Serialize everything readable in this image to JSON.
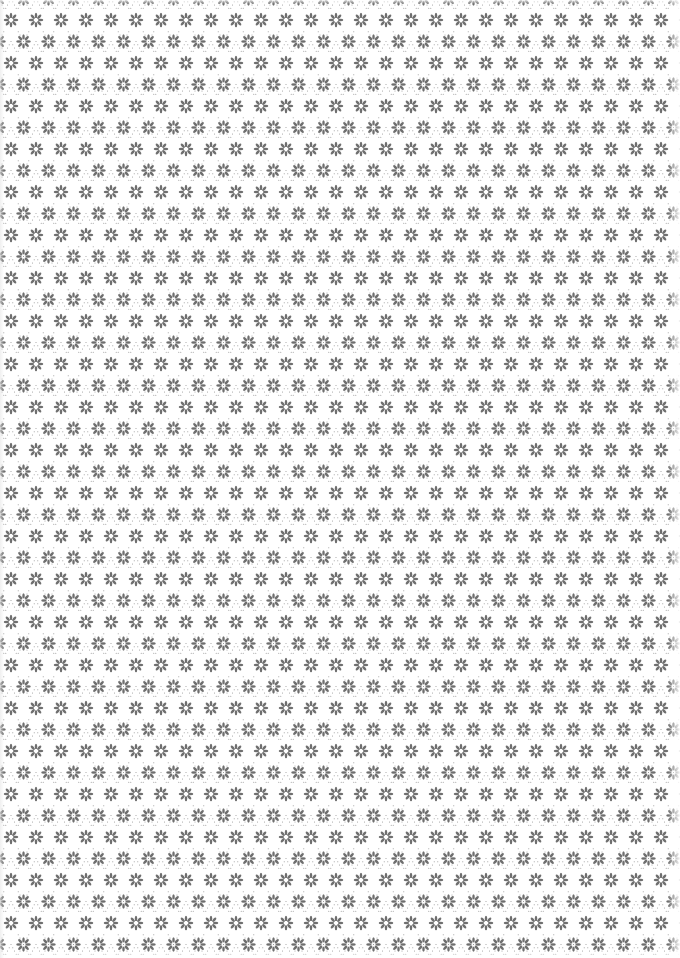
{
  "pattern": {
    "motif": "eight-petal-flower",
    "lattice": "diagonal-dotted-diamond",
    "tile_width": 25,
    "tile_height": 43,
    "offset_x": 11,
    "offset_y": -1,
    "background_color": "#ffffff",
    "flower_color": "#6f6f6f",
    "dot_color": "#9a9a9a"
  }
}
